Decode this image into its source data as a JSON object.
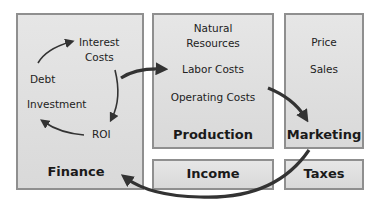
{
  "boxes": {
    "finance": {
      "title": "Finance",
      "items": [
        "Interest",
        "Costs",
        "Debt",
        "Investment",
        "ROI"
      ]
    },
    "production": {
      "title": "Production",
      "items": [
        "Natural",
        "Resources",
        "Labor Costs",
        "Operating Costs"
      ]
    },
    "marketing": {
      "title": "Marketing",
      "items": [
        "Price",
        "Sales"
      ]
    },
    "income": {
      "title": "Income"
    },
    "taxes": {
      "title": "Taxes"
    }
  },
  "colors": {
    "box_fill": "#e0e0e0",
    "box_border": "#8f8f8f",
    "arrow": "#333333"
  }
}
